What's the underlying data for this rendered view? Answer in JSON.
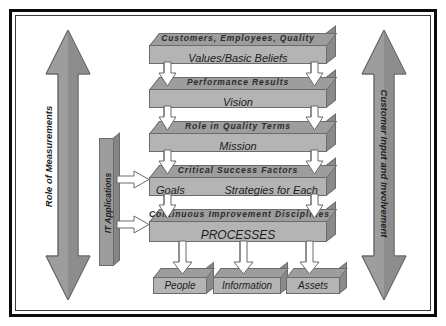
{
  "diagram": {
    "colors": {
      "band_top": "#9d9d9d",
      "band_front": "#b4b4b4",
      "band_side": "#8a8a8a",
      "outline": "#6b6b6b",
      "arrow_fill": "#ffffff",
      "arrow_outline": "#6b6b6b",
      "frame": "#0a0a0a",
      "background": "#ffffff"
    },
    "left_arrow": {
      "label": "Role of Measurements",
      "direction": "double-vertical"
    },
    "right_arrow": {
      "label": "Customer Input and Involvement",
      "direction": "double-vertical"
    },
    "it_bar": {
      "label": "IT Applications",
      "arrow_count": 2,
      "arrow_direction": "right"
    },
    "bands": [
      {
        "top_label": "Customers,   Employees,   Quality",
        "front_label": "Values/Basic Beliefs",
        "front_align": "center",
        "front_label_2": ""
      },
      {
        "top_label": "Performance    Results",
        "front_label": "Vision",
        "front_align": "center",
        "front_label_2": ""
      },
      {
        "top_label": "Role   in   Quality   Terms",
        "front_label": "Mission",
        "front_align": "center",
        "front_label_2": ""
      },
      {
        "top_label": "Critical    Success    Factors",
        "front_label": "Goals",
        "front_align": "split",
        "front_label_2": "Strategies for Each"
      },
      {
        "top_label": "Continuous   Improvement   Disciplines",
        "front_label": "PROCESSES",
        "front_align": "center",
        "front_label_2": ""
      }
    ],
    "outputs": [
      {
        "label": "People"
      },
      {
        "label": "Information"
      },
      {
        "label": "Assets"
      }
    ]
  }
}
